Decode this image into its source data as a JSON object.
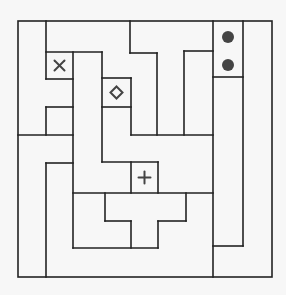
{
  "puzzle": {
    "type": "maze-region-puzzle",
    "frame": {
      "x1": 18,
      "y1": 21,
      "x2": 272,
      "y2": 277
    },
    "colors": {
      "wall": "#222222",
      "symbol": "#444444",
      "background": "#f7f7f7"
    },
    "walls": [
      [
        46,
        21,
        46,
        79
      ],
      [
        46,
        52,
        102,
        52
      ],
      [
        46,
        79,
        73,
        79
      ],
      [
        73,
        52,
        73,
        248
      ],
      [
        102,
        52,
        102,
        162
      ],
      [
        46,
        107,
        73,
        107
      ],
      [
        46,
        107,
        46,
        135
      ],
      [
        18,
        135,
        73,
        135
      ],
      [
        46,
        163,
        73,
        163
      ],
      [
        46,
        163,
        46,
        277
      ],
      [
        102,
        78,
        131,
        78
      ],
      [
        102,
        107,
        131,
        107
      ],
      [
        131,
        78,
        131,
        135
      ],
      [
        130,
        21,
        130,
        53
      ],
      [
        130,
        53,
        157,
        53
      ],
      [
        157,
        53,
        157,
        135
      ],
      [
        184,
        51,
        184,
        135
      ],
      [
        184,
        51,
        213,
        51
      ],
      [
        131,
        135,
        213,
        135
      ],
      [
        102,
        162,
        158,
        162
      ],
      [
        131,
        162,
        131,
        193
      ],
      [
        158,
        162,
        158,
        193
      ],
      [
        73,
        193,
        213,
        193
      ],
      [
        105,
        193,
        105,
        221
      ],
      [
        105,
        221,
        131,
        221
      ],
      [
        131,
        221,
        131,
        248
      ],
      [
        73,
        248,
        158,
        248
      ],
      [
        158,
        221,
        158,
        248
      ],
      [
        158,
        221,
        186,
        221
      ],
      [
        186,
        193,
        186,
        221
      ],
      [
        213,
        21,
        213,
        277
      ],
      [
        243,
        21,
        243,
        246
      ],
      [
        213,
        77,
        243,
        77
      ],
      [
        213,
        246,
        243,
        246
      ]
    ],
    "symbols": [
      {
        "name": "cross-x-icon",
        "shape": "x",
        "cx": 59.5,
        "cy": 65.5
      },
      {
        "name": "diamond-icon",
        "shape": "diamond",
        "cx": 116.5,
        "cy": 92.5
      },
      {
        "name": "plus-icon",
        "shape": "plus",
        "cx": 144.5,
        "cy": 177.5
      },
      {
        "name": "dot-icon",
        "shape": "dot",
        "cx": 228,
        "cy": 37
      },
      {
        "name": "dot-icon",
        "shape": "dot",
        "cx": 228,
        "cy": 65
      }
    ]
  }
}
